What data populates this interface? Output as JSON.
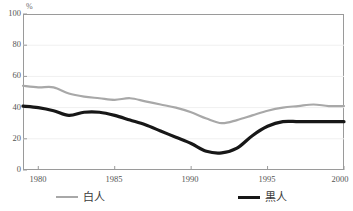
{
  "chart_data": {
    "type": "line",
    "title": "",
    "subtitle": "",
    "xlabel": "",
    "ylabel": "",
    "unit_label": "%",
    "xlim": [
      1979,
      2000
    ],
    "ylim": [
      0,
      100
    ],
    "grid": true,
    "legend_position": "bottom",
    "x": [
      1979,
      1980,
      1981,
      1982,
      1983,
      1984,
      1985,
      1986,
      1987,
      1988,
      1989,
      1990,
      1991,
      1992,
      1993,
      1994,
      1995,
      1996,
      1997,
      1998,
      1999,
      2000
    ],
    "xticks": [
      1980,
      1985,
      1990,
      1995,
      2000
    ],
    "xtick_labels": [
      "1980",
      "1985",
      "1990",
      "1995",
      "2000"
    ],
    "yticks": [
      0,
      20,
      40,
      60,
      80,
      100
    ],
    "ytick_labels": [
      "0",
      "20",
      "40",
      "60",
      "80",
      "100"
    ],
    "series": [
      {
        "name": "白人",
        "color": "#a8a8a8",
        "values": [
          54,
          53,
          53,
          49,
          47,
          46,
          45,
          46,
          44,
          42,
          40,
          37,
          33,
          30,
          32,
          35,
          38,
          40,
          41,
          42,
          41,
          41
        ]
      },
      {
        "name": "黒人",
        "color": "#171717",
        "values": [
          41,
          40,
          38,
          35,
          37,
          37,
          35,
          32,
          29,
          25,
          21,
          17,
          12,
          11,
          14,
          22,
          28,
          31,
          31,
          31,
          31,
          31
        ]
      }
    ]
  },
  "legend": {
    "items": [
      {
        "label": "白人"
      },
      {
        "label": "黒人"
      }
    ]
  }
}
